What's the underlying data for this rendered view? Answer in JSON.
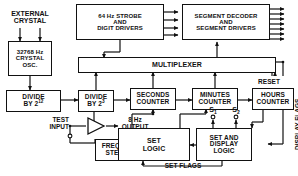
{
  "blocks": {
    "strobe": {
      "line1": "64 Hz  STROBE",
      "line2": "AND",
      "line3": "DIGIT  DRIVERS"
    },
    "segment_decoder": {
      "line1": "SEGMENT  DECODER",
      "line2": "AND",
      "line3": "SEGMENT  DRIVERS"
    },
    "multiplexer": {
      "label": "MULTIPLEXER"
    },
    "crystal_osc": {
      "line1": "32768 Hz",
      "line2": "CRYSTAL",
      "line3": "OSC."
    },
    "divide_12": {
      "line1": "DIVIDE",
      "line2_pre": "BY  2",
      "line2_sup": "12"
    },
    "divide_3": {
      "line1": "DIVIDE",
      "line2_pre": "BY  2",
      "line2_sup": "3"
    },
    "seconds_counter": {
      "line1": "SECONDS",
      "line2": "COUNTER"
    },
    "minutes_counter": {
      "line1": "MINUTES",
      "line2": "COUNTER"
    },
    "hours_counter": {
      "line1": "HOURS",
      "line2": "COUNTER"
    },
    "frequency_steering": {
      "line1": "FREQUENCY",
      "line2": "STEERING"
    },
    "set_logic": {
      "line1": "SET",
      "line2": "LOGIC"
    },
    "set_display_logic": {
      "line1": "SET  AND",
      "line2": "DISPLAY",
      "line3": "LOGIC"
    }
  },
  "labels": {
    "external_crystal": {
      "line1": "EXTERNAL",
      "line2": "CRYSTAL"
    },
    "test_input": {
      "line1": "TEST",
      "line2": "INPUT"
    },
    "output_8hz": {
      "line1": "8 Hz",
      "line2": "OUTPUT"
    },
    "reset": "RESET",
    "display_flags": "DISPLAY FLAGS",
    "set_flags": "SET FLAGS",
    "s1_pre": "S",
    "s1_sub": "1",
    "s2_pre": "S",
    "s2_sub": "2"
  },
  "colors": {
    "line": "#111111",
    "box_fill": "#ffffff",
    "background": "#ffffff",
    "text": "#111111"
  }
}
